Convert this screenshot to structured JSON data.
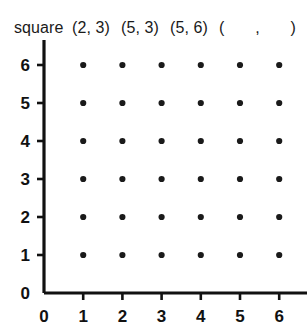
{
  "prompt": {
    "label": "square",
    "vertices": [
      "(2, 3)",
      "(5, 3)",
      "(5, 6)"
    ],
    "blank": {
      "open_paren": "(",
      "comma": ",",
      "close_paren": ")",
      "x_value": "",
      "y_value": ""
    }
  },
  "chart_data": {
    "type": "scatter",
    "title": "square (2, 3) (5, 3) (5, 6) (  ,  )",
    "xlabel": "",
    "ylabel": "",
    "xlim": [
      0,
      6
    ],
    "ylim": [
      0,
      6
    ],
    "x_ticks": [
      "0",
      "1",
      "2",
      "3",
      "4",
      "5",
      "6"
    ],
    "y_ticks": [
      "0",
      "1",
      "2",
      "3",
      "4",
      "5",
      "6"
    ],
    "grid": false,
    "legend": null,
    "axis_arrows": true,
    "dot_color": "#1a1a1a",
    "axis_color": "#111111",
    "lattice_points": [
      [
        1,
        1
      ],
      [
        2,
        1
      ],
      [
        3,
        1
      ],
      [
        4,
        1
      ],
      [
        5,
        1
      ],
      [
        6,
        1
      ],
      [
        1,
        2
      ],
      [
        2,
        2
      ],
      [
        3,
        2
      ],
      [
        4,
        2
      ],
      [
        5,
        2
      ],
      [
        6,
        2
      ],
      [
        1,
        3
      ],
      [
        2,
        3
      ],
      [
        3,
        3
      ],
      [
        4,
        3
      ],
      [
        5,
        3
      ],
      [
        6,
        3
      ],
      [
        1,
        4
      ],
      [
        2,
        4
      ],
      [
        3,
        4
      ],
      [
        4,
        4
      ],
      [
        5,
        4
      ],
      [
        6,
        4
      ],
      [
        1,
        5
      ],
      [
        2,
        5
      ],
      [
        3,
        5
      ],
      [
        4,
        5
      ],
      [
        5,
        5
      ],
      [
        6,
        5
      ],
      [
        1,
        6
      ],
      [
        2,
        6
      ],
      [
        3,
        6
      ],
      [
        4,
        6
      ],
      [
        5,
        6
      ],
      [
        6,
        6
      ]
    ],
    "given_vertices": [
      [
        2,
        3
      ],
      [
        5,
        3
      ],
      [
        5,
        6
      ]
    ],
    "missing_vertex": null
  }
}
